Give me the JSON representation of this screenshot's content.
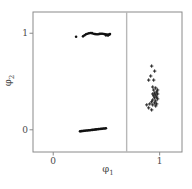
{
  "figure": {
    "background": "#ffffff",
    "frame_color": "#8a8a8a",
    "tick_color": "#8a8a8a",
    "text_color": "#4a4a4a"
  },
  "chart_data": {
    "type": "scatter",
    "title": "",
    "xlabel": {
      "symbol": "φ",
      "sub": "1"
    },
    "ylabel": {
      "symbol": "φ",
      "sub": "2"
    },
    "xlim": [
      -0.19,
      1.21
    ],
    "ylim": [
      -0.23,
      1.22
    ],
    "grid": false,
    "legend": "none",
    "x_ticks": [
      {
        "value": 0,
        "label": "0"
      },
      {
        "value": 1,
        "label": "1"
      }
    ],
    "y_ticks": [
      {
        "value": 1,
        "label": "1"
      },
      {
        "value": 0,
        "label": "0"
      }
    ],
    "vline": {
      "x": 0.69,
      "color": "#b8b8b8"
    },
    "point_color": "#111111",
    "series": [
      {
        "name": "cluster-upper-left",
        "marker": "dot",
        "points": [
          [
            0.215,
            0.964
          ],
          [
            0.28,
            0.968
          ],
          [
            0.294,
            0.979
          ],
          [
            0.308,
            0.99
          ],
          [
            0.322,
            0.995
          ],
          [
            0.336,
            1.0
          ],
          [
            0.35,
            1.003
          ],
          [
            0.364,
            1.001
          ],
          [
            0.379,
            0.995
          ],
          [
            0.393,
            0.991
          ],
          [
            0.407,
            0.989
          ],
          [
            0.421,
            0.989
          ],
          [
            0.435,
            0.993
          ],
          [
            0.449,
            0.995
          ],
          [
            0.463,
            0.995
          ],
          [
            0.477,
            0.992
          ],
          [
            0.491,
            0.99
          ],
          [
            0.505,
            0.986
          ],
          [
            0.519,
            0.983
          ],
          [
            0.528,
            0.988
          ],
          [
            0.533,
            0.992
          ],
          [
            0.495,
            0.978
          ],
          [
            0.514,
            0.976
          ]
        ]
      },
      {
        "name": "cluster-lower-left",
        "marker": "dot",
        "points": [
          [
            0.252,
            -0.016
          ],
          [
            0.264,
            -0.014
          ],
          [
            0.275,
            -0.013
          ],
          [
            0.287,
            -0.011
          ],
          [
            0.298,
            -0.01
          ],
          [
            0.31,
            -0.008
          ],
          [
            0.322,
            -0.007
          ],
          [
            0.333,
            -0.005
          ],
          [
            0.345,
            -0.004
          ],
          [
            0.356,
            -0.002
          ],
          [
            0.368,
            -0.001
          ],
          [
            0.38,
            0.001
          ],
          [
            0.391,
            0.002
          ],
          [
            0.403,
            0.004
          ],
          [
            0.414,
            0.005
          ],
          [
            0.426,
            0.007
          ],
          [
            0.438,
            0.008
          ],
          [
            0.449,
            0.01
          ],
          [
            0.461,
            0.011
          ],
          [
            0.472,
            0.013
          ],
          [
            0.484,
            0.014
          ],
          [
            0.495,
            0.016
          ]
        ]
      },
      {
        "name": "cluster-right",
        "marker": "plus",
        "points": [
          [
            0.925,
            0.66
          ],
          [
            0.953,
            0.608
          ],
          [
            0.916,
            0.557
          ],
          [
            0.897,
            0.515
          ],
          [
            0.944,
            0.515
          ],
          [
            0.935,
            0.443
          ],
          [
            0.963,
            0.433
          ],
          [
            0.981,
            0.412
          ],
          [
            0.944,
            0.412
          ],
          [
            0.972,
            0.392
          ],
          [
            0.953,
            0.381
          ],
          [
            0.981,
            0.371
          ],
          [
            0.935,
            0.371
          ],
          [
            0.963,
            0.361
          ],
          [
            0.944,
            0.351
          ],
          [
            0.972,
            0.34
          ],
          [
            0.953,
            0.33
          ],
          [
            0.981,
            0.32
          ],
          [
            0.935,
            0.309
          ],
          [
            0.963,
            0.299
          ],
          [
            0.925,
            0.289
          ],
          [
            0.953,
            0.278
          ],
          [
            0.972,
            0.268
          ],
          [
            0.907,
            0.268
          ],
          [
            0.935,
            0.258
          ],
          [
            0.963,
            0.247
          ],
          [
            0.879,
            0.258
          ],
          [
            0.897,
            0.227
          ],
          [
            0.925,
            0.206
          ]
        ]
      }
    ]
  }
}
